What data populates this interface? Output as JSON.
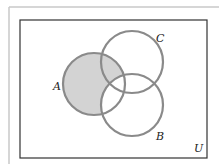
{
  "diagram": {
    "type": "venn",
    "universe_label": "U",
    "sets": [
      {
        "name": "A",
        "label": "A",
        "cx": 94,
        "cy": 84,
        "r": 31
      },
      {
        "name": "C",
        "label": "C",
        "cx": 132,
        "cy": 62,
        "r": 31
      },
      {
        "name": "B",
        "label": "B",
        "cx": 132,
        "cy": 105,
        "r": 31
      }
    ],
    "shaded_region": "A minus B",
    "colors": {
      "circle_stroke": "#8a8a8a",
      "shade_fill": "#d3d3d3",
      "frame_stroke": "#333333",
      "outer_frame_stroke": "#c8c8c8"
    }
  }
}
